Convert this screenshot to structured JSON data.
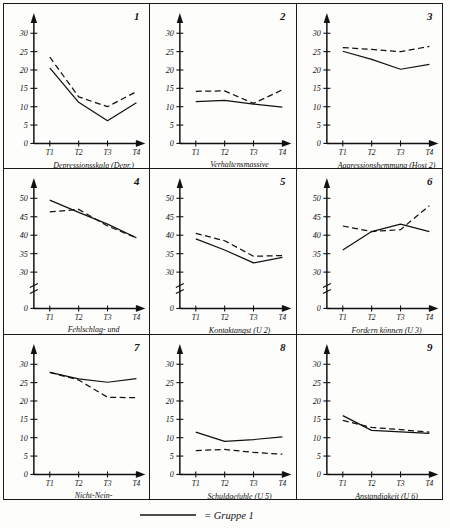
{
  "figure": {
    "legend": {
      "label": "= Gruppe 1",
      "line_style": "solid"
    },
    "xticks": [
      "T1",
      "T2",
      "T3",
      "T4"
    ]
  },
  "chart_data": [
    {
      "type": "line",
      "panel": "1",
      "title": "Depressionsskala (Depr.)",
      "xlabel": "",
      "ylabel": "",
      "x": [
        "T1",
        "T2",
        "T3",
        "T4"
      ],
      "yticks": [
        0,
        5,
        10,
        15,
        20,
        25,
        30
      ],
      "ylim": [
        0,
        32
      ],
      "broken_axis": false,
      "grid": false,
      "legend_position": "below-figure",
      "series": [
        {
          "name": "Gruppe 1",
          "style": "solid",
          "values": [
            20.6,
            11.2,
            6.2,
            11.1
          ]
        },
        {
          "name": "Gruppe 2",
          "style": "dashed",
          "values": [
            23.5,
            12.7,
            10.0,
            14.1
          ]
        }
      ]
    },
    {
      "type": "line",
      "panel": "2",
      "title": "Verhaltensmassive Aggression (Host 1)",
      "title_line1": "Verhaltensmassive",
      "title_line2": "Aggression (Host 1)",
      "x": [
        "T1",
        "T2",
        "T3",
        "T4"
      ],
      "yticks": [
        0,
        5,
        10,
        15,
        20,
        25,
        30
      ],
      "ylim": [
        0,
        32
      ],
      "broken_axis": false,
      "grid": false,
      "series": [
        {
          "name": "Gruppe 1",
          "style": "solid",
          "values": [
            11.4,
            11.7,
            10.7,
            9.9
          ]
        },
        {
          "name": "Gruppe 2",
          "style": "dashed",
          "values": [
            14.2,
            14.3,
            10.9,
            14.6
          ]
        }
      ]
    },
    {
      "type": "line",
      "panel": "3",
      "title": "Aggressionshemmung (Host 2)",
      "x": [
        "T1",
        "T2",
        "T3",
        "T4"
      ],
      "yticks": [
        0,
        5,
        10,
        15,
        20,
        25,
        30
      ],
      "ylim": [
        0,
        32
      ],
      "broken_axis": false,
      "grid": false,
      "series": [
        {
          "name": "Gruppe 1",
          "style": "solid",
          "values": [
            25.1,
            22.9,
            20.2,
            21.5
          ]
        },
        {
          "name": "Gruppe 2",
          "style": "dashed",
          "values": [
            26.1,
            25.6,
            25.0,
            26.4
          ]
        }
      ]
    },
    {
      "type": "line",
      "panel": "4",
      "title": "Fehlschlag- und Kritikangst (U 1)",
      "title_line1": "Fehlschlag- und",
      "title_line2": "Kritikangst (U 1)",
      "x": [
        "T1",
        "T2",
        "T3",
        "T4"
      ],
      "yticks": [
        0,
        30,
        35,
        40,
        45,
        50
      ],
      "ylim": [
        0,
        52
      ],
      "broken_axis": true,
      "grid": false,
      "series": [
        {
          "name": "Gruppe 1",
          "style": "solid",
          "values": [
            49.5,
            46.2,
            43.0,
            39.3
          ]
        },
        {
          "name": "Gruppe 2",
          "style": "dashed",
          "values": [
            46.3,
            47.0,
            42.5,
            39.3
          ]
        }
      ]
    },
    {
      "type": "line",
      "panel": "5",
      "title": "Kontaktangst (U 2)",
      "x": [
        "T1",
        "T2",
        "T3",
        "T4"
      ],
      "yticks": [
        0,
        30,
        35,
        40,
        45,
        50
      ],
      "ylim": [
        0,
        52
      ],
      "broken_axis": true,
      "grid": false,
      "series": [
        {
          "name": "Gruppe 1",
          "style": "solid",
          "values": [
            39.0,
            36.0,
            32.5,
            34.0
          ]
        },
        {
          "name": "Gruppe 2",
          "style": "dashed",
          "values": [
            40.5,
            38.5,
            34.3,
            34.5
          ]
        }
      ]
    },
    {
      "type": "line",
      "panel": "6",
      "title": "Fordern können (U 3)",
      "x": [
        "T1",
        "T2",
        "T3",
        "T4"
      ],
      "yticks": [
        0,
        30,
        35,
        40,
        45,
        50
      ],
      "ylim": [
        0,
        52
      ],
      "broken_axis": true,
      "grid": false,
      "series": [
        {
          "name": "Gruppe 1",
          "style": "solid",
          "values": [
            36.0,
            41.0,
            43.0,
            41.0
          ]
        },
        {
          "name": "Gruppe 2",
          "style": "dashed",
          "values": [
            42.5,
            41.0,
            41.5,
            48.0
          ]
        }
      ]
    },
    {
      "type": "line",
      "panel": "7",
      "title": "Nicht-Nein-Sagen-können (U 4)",
      "title_line1": "Nicht-Nein-",
      "title_line2": "Sagen-können (U 4)",
      "x": [
        "T1",
        "T2",
        "T3",
        "T4"
      ],
      "yticks": [
        0,
        5,
        10,
        15,
        20,
        25,
        30
      ],
      "ylim": [
        0,
        32
      ],
      "broken_axis": false,
      "grid": false,
      "series": [
        {
          "name": "Gruppe 1",
          "style": "solid",
          "values": [
            27.8,
            26.0,
            25.1,
            26.1
          ]
        },
        {
          "name": "Gruppe 2",
          "style": "dashed",
          "values": [
            27.8,
            25.7,
            21.0,
            20.9
          ]
        }
      ]
    },
    {
      "type": "line",
      "panel": "8",
      "title": "Schuldgefuhle (U 5)",
      "x": [
        "T1",
        "T2",
        "T3",
        "T4"
      ],
      "yticks": [
        0,
        5,
        10,
        15,
        20,
        25,
        30
      ],
      "ylim": [
        0,
        32
      ],
      "broken_axis": false,
      "grid": false,
      "series": [
        {
          "name": "Gruppe 1",
          "style": "solid",
          "values": [
            11.5,
            9.0,
            9.5,
            10.2
          ]
        },
        {
          "name": "Gruppe 2",
          "style": "dashed",
          "values": [
            6.5,
            6.8,
            6.0,
            5.5
          ]
        }
      ]
    },
    {
      "type": "line",
      "panel": "9",
      "title": "Anstandigkeit (U 6)",
      "x": [
        "T1",
        "T2",
        "T3",
        "T4"
      ],
      "yticks": [
        0,
        5,
        10,
        15,
        20,
        25,
        30
      ],
      "ylim": [
        0,
        32
      ],
      "broken_axis": false,
      "grid": false,
      "series": [
        {
          "name": "Gruppe 1",
          "style": "solid",
          "values": [
            16.0,
            12.0,
            11.6,
            11.2
          ]
        },
        {
          "name": "Gruppe 2",
          "style": "dashed",
          "values": [
            14.7,
            12.8,
            12.2,
            11.5
          ]
        }
      ]
    }
  ]
}
